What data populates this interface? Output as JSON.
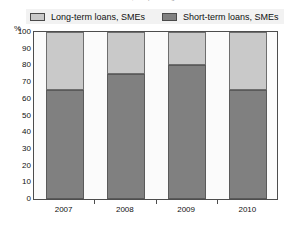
{
  "title": {
    "cropped_text": "Annual, as a percentage"
  },
  "legend": {
    "position": "top",
    "entries": [
      {
        "label": "Long-term loans, SMEs",
        "color": "#c9c9c9",
        "icon": "legend-swatch-icon"
      },
      {
        "label": "Short-term loans, SMEs",
        "color": "#808080",
        "icon": "legend-swatch-icon"
      }
    ]
  },
  "axis": {
    "y_unit": "%",
    "y_ticks": [
      "100",
      "90",
      "80",
      "70",
      "60",
      "50",
      "40",
      "30",
      "20",
      "10",
      "0"
    ],
    "x_ticks": [
      "2007",
      "2008",
      "2009",
      "2010"
    ]
  },
  "chart_data": {
    "type": "bar",
    "stacked": true,
    "title": "Annual, as a percentage",
    "xlabel": "",
    "ylabel": "%",
    "ylim": [
      0,
      100
    ],
    "ytick_step": 10,
    "grid": false,
    "legend_position": "top",
    "categories": [
      "2007",
      "2008",
      "2009",
      "2010"
    ],
    "series": [
      {
        "name": "Short-term loans, SMEs",
        "color": "#808080",
        "values": [
          65,
          75,
          80,
          65
        ]
      },
      {
        "name": "Long-term loans, SMEs",
        "color": "#c9c9c9",
        "values": [
          35,
          25,
          20,
          35
        ]
      }
    ]
  }
}
